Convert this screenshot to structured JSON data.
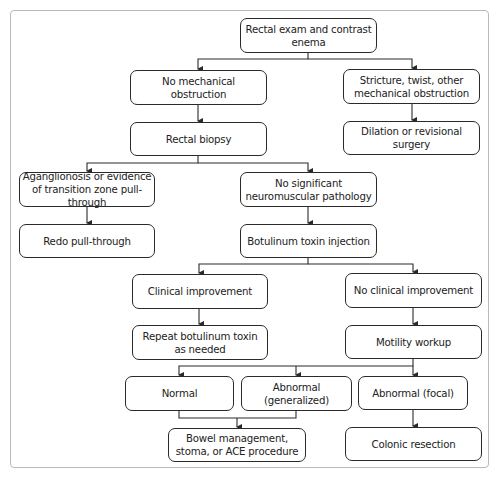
{
  "diagram": {
    "type": "flowchart",
    "nodes": {
      "start": "Rectal exam and contrast enema",
      "no_obstruction": "No mechanical obstruction",
      "stricture": "Stricture, twist, other mechanical obstruction",
      "rectal_biopsy": "Rectal biopsy",
      "dilation": "Dilation or revisional surgery",
      "aganglionosis": "Aganglionosis or evidence of transition zone pull-through",
      "no_pathology": "No significant neuromuscular pathology",
      "redo": "Redo pull-through",
      "botox": "Botulinum toxin injection",
      "clinical_improvement": "Clinical improvement",
      "no_clinical_improvement": "No clinical improvement",
      "repeat_botox": "Repeat botulinum toxin as needed",
      "motility": "Motility workup",
      "normal": "Normal",
      "abnormal_generalized": "Abnormal (generalized)",
      "abnormal_focal": "Abnormal (focal)",
      "bowel_management": "Bowel management, stoma, or ACE procedure",
      "colonic_resection": "Colonic resection"
    },
    "edges": [
      [
        "start",
        "no_obstruction"
      ],
      [
        "start",
        "stricture"
      ],
      [
        "no_obstruction",
        "rectal_biopsy"
      ],
      [
        "stricture",
        "dilation"
      ],
      [
        "rectal_biopsy",
        "aganglionosis"
      ],
      [
        "rectal_biopsy",
        "no_pathology"
      ],
      [
        "aganglionosis",
        "redo"
      ],
      [
        "no_pathology",
        "botox"
      ],
      [
        "botox",
        "clinical_improvement"
      ],
      [
        "botox",
        "no_clinical_improvement"
      ],
      [
        "clinical_improvement",
        "repeat_botox"
      ],
      [
        "no_clinical_improvement",
        "motility"
      ],
      [
        "motility",
        "normal"
      ],
      [
        "motility",
        "abnormal_generalized"
      ],
      [
        "motility",
        "abnormal_focal"
      ],
      [
        "normal",
        "bowel_management"
      ],
      [
        "abnormal_generalized",
        "bowel_management"
      ],
      [
        "abnormal_focal",
        "colonic_resection"
      ]
    ],
    "colors": {
      "line": "#2a2a2a",
      "frame": "#b9b9b9",
      "text": "#222222"
    }
  }
}
